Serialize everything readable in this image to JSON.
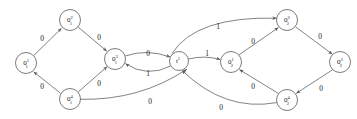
{
  "figure": {
    "kind": "finite-state-automaton-diagram",
    "stroke_color": "#5a5a5a",
    "text_color": "#1a1a1a",
    "background_color": "#ffffff"
  },
  "nodes": [
    {
      "id": "q11",
      "base": "0",
      "sup": "1",
      "sub": "1",
      "cx": 26,
      "cy": 63,
      "r": 10.5
    },
    {
      "id": "q12",
      "base": "0",
      "sup": "2",
      "sub": "1",
      "cx": 70,
      "cy": 20,
      "r": 10.5
    },
    {
      "id": "q13",
      "base": "0",
      "sup": "3",
      "sub": "1",
      "cx": 115,
      "cy": 59,
      "r": 10.5
    },
    {
      "id": "q14",
      "base": "0",
      "sup": "4",
      "sub": "1",
      "cx": 70,
      "cy": 99,
      "r": 10.5
    },
    {
      "id": "t1",
      "base": "t",
      "sup": "1",
      "sub": "",
      "cx": 179,
      "cy": 61,
      "r": 9.5
    },
    {
      "id": "q21",
      "base": "0",
      "sup": "1",
      "sub": "2",
      "cx": 231,
      "cy": 62,
      "r": 10.5
    },
    {
      "id": "q22",
      "base": "0",
      "sup": "2",
      "sub": "2",
      "cx": 287,
      "cy": 20,
      "r": 10.5
    },
    {
      "id": "q23",
      "base": "0",
      "sup": "3",
      "sub": "2",
      "cx": 340,
      "cy": 62,
      "r": 10.5
    },
    {
      "id": "q24",
      "base": "0",
      "sup": "4",
      "sub": "2",
      "cx": 287,
      "cy": 100,
      "r": 10.5
    }
  ],
  "edges": [
    {
      "id": "e1",
      "from": "q11",
      "to": "q12",
      "label": "0",
      "label_x": 42,
      "label_y": 38
    },
    {
      "id": "e2",
      "from": "q12",
      "to": "q13",
      "label": "0",
      "label_x": 99,
      "label_y": 37
    },
    {
      "id": "e3",
      "from": "q14",
      "to": "q13",
      "label": "0",
      "label_x": 99,
      "label_y": 83
    },
    {
      "id": "e4",
      "from": "q14",
      "to": "q11",
      "label": "0",
      "label_x": 42,
      "label_y": 86
    },
    {
      "id": "e5",
      "from": "q13",
      "to": "t1",
      "label": "0",
      "label_x": 148,
      "label_y": 53
    },
    {
      "id": "e6",
      "from": "t1",
      "to": "q13",
      "label": "1",
      "label_x": 148,
      "label_y": 73
    },
    {
      "id": "e7",
      "from": "t1",
      "to": "q22",
      "label": "1",
      "label_x": 218,
      "label_y": 26
    },
    {
      "id": "e8",
      "from": "t1",
      "to": "q21",
      "label": "1",
      "label_x": 207,
      "label_y": 53
    },
    {
      "id": "e9",
      "from": "q21",
      "to": "q22",
      "label": "0",
      "label_x": 253,
      "label_y": 41
    },
    {
      "id": "e10",
      "from": "q22",
      "to": "q23",
      "label": "0",
      "label_x": 320,
      "label_y": 36
    },
    {
      "id": "e11",
      "from": "q23",
      "to": "q24",
      "label": "0",
      "label_x": 321,
      "label_y": 88
    },
    {
      "id": "e12",
      "from": "q24",
      "to": "q21",
      "label": "0",
      "label_x": 253,
      "label_y": 86
    },
    {
      "id": "e13",
      "from": "q14",
      "to": "t1",
      "label": "0",
      "label_x": 150,
      "label_y": 101
    },
    {
      "id": "e14",
      "from": "q24",
      "to": "t1",
      "label": "0",
      "label_x": 221,
      "label_y": 107
    }
  ],
  "alphabet": {
    "symbols": [
      "0",
      "1"
    ]
  }
}
